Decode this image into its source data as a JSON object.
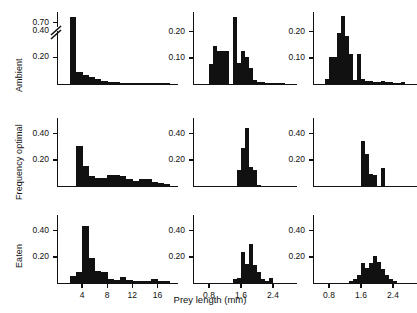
{
  "figure": {
    "xlabel": "Prey length (mm)",
    "row_labels": [
      "Ambient",
      "Frequency optimal",
      "Eaten"
    ],
    "ink_color": "#111111"
  },
  "chart_data": [
    {
      "id": "ambient-left",
      "type": "bar",
      "row": "Ambient",
      "column": 1,
      "title": "",
      "xlabel": "",
      "ylabel": "Ambient",
      "xlim": [
        0,
        18
      ],
      "ylim": [
        0,
        0.78
      ],
      "axis_break": {
        "from": 0.42,
        "to": 0.66,
        "note": "broken y-axis between 0.40 and 0.70"
      },
      "ytick_labels": [
        "0.70",
        "0.40",
        "0.20"
      ],
      "yticks": [
        0.7,
        0.4,
        0.2
      ],
      "xtick_labels": [
        "4",
        "8",
        "12",
        "16"
      ],
      "xticks": [
        4,
        8,
        12,
        16
      ],
      "bin_width": 1,
      "x": [
        2,
        3,
        4,
        5,
        6,
        7,
        8,
        9,
        10,
        11,
        12,
        13,
        14,
        15,
        16,
        17
      ],
      "values": [
        0.74,
        0.09,
        0.07,
        0.055,
        0.035,
        0.022,
        0.015,
        0.012,
        0.01,
        0.008,
        0.008,
        0.006,
        0.006,
        0.005,
        0.004,
        0.004
      ],
      "grid": false
    },
    {
      "id": "ambient-middle",
      "type": "bar",
      "row": "Ambient",
      "column": 2,
      "title": "",
      "xlabel": "",
      "ylabel": "",
      "xlim": [
        0.4,
        2.8
      ],
      "ylim": [
        0,
        0.275
      ],
      "ytick_labels": [
        "0.20",
        "0.10"
      ],
      "yticks": [
        0.2,
        0.1
      ],
      "xtick_labels": [
        "0.8",
        "1.6",
        "2.4"
      ],
      "xticks": [
        0.8,
        1.6,
        2.4
      ],
      "bin_width": 0.1,
      "x": [
        0.8,
        0.9,
        1.0,
        1.1,
        1.2,
        1.3,
        1.4,
        1.5,
        1.6,
        1.7,
        1.8,
        1.9,
        2.0,
        2.1,
        2.2,
        2.3,
        2.4,
        2.5,
        2.6
      ],
      "values": [
        0.075,
        0.145,
        0.125,
        0.125,
        0.125,
        0.0,
        0.255,
        0.08,
        0.125,
        0.105,
        0.06,
        0.015,
        0.008,
        0.006,
        0.005,
        0.004,
        0.004,
        0.003,
        0.003
      ],
      "grid": false
    },
    {
      "id": "ambient-right",
      "type": "bar",
      "row": "Ambient",
      "column": 3,
      "title": "",
      "xlabel": "",
      "ylabel": "",
      "xlim": [
        0.4,
        2.8
      ],
      "ylim": [
        0,
        0.275
      ],
      "ytick_labels": [
        "0.20",
        "0.10"
      ],
      "yticks": [
        0.2,
        0.1
      ],
      "xtick_labels": [
        "0.8",
        "1.6",
        "2.4"
      ],
      "xticks": [
        0.8,
        1.6,
        2.4
      ],
      "bin_width": 0.1,
      "x": [
        0.7,
        0.8,
        0.9,
        1.0,
        1.1,
        1.2,
        1.3,
        1.4,
        1.5,
        1.6,
        1.7,
        1.8,
        1.9,
        2.0,
        2.1,
        2.2,
        2.3,
        2.4,
        2.5,
        2.6
      ],
      "values": [
        0.02,
        0.105,
        0.105,
        0.195,
        0.26,
        0.185,
        0.115,
        0.015,
        0.115,
        0.02,
        0.012,
        0.01,
        0.009,
        0.008,
        0.012,
        0.008,
        0.006,
        0.005,
        0.004,
        0.008
      ],
      "grid": false
    },
    {
      "id": "frequency-optimal-left",
      "type": "bar",
      "row": "Frequency optimal",
      "column": 1,
      "title": "",
      "xlabel": "",
      "ylabel": "Frequency optimal",
      "xlim": [
        0,
        18
      ],
      "ylim": [
        0,
        0.52
      ],
      "ytick_labels": [
        "0.40",
        "0.20"
      ],
      "yticks": [
        0.4,
        0.2
      ],
      "xtick_labels": [
        "4",
        "8",
        "12",
        "16"
      ],
      "xticks": [
        4,
        8,
        12,
        16
      ],
      "bin_width": 1,
      "x": [
        3,
        4,
        5,
        6,
        7,
        8,
        9,
        10,
        11,
        12,
        13,
        14,
        15,
        16,
        17
      ],
      "values": [
        0.305,
        0.155,
        0.075,
        0.06,
        0.065,
        0.085,
        0.085,
        0.075,
        0.055,
        0.035,
        0.055,
        0.055,
        0.03,
        0.025,
        0.012
      ],
      "grid": false
    },
    {
      "id": "frequency-optimal-middle",
      "type": "bar",
      "row": "Frequency optimal",
      "column": 2,
      "title": "",
      "xlabel": "",
      "ylabel": "",
      "xlim": [
        0.4,
        2.8
      ],
      "ylim": [
        0,
        0.52
      ],
      "ytick_labels": [
        "0.40",
        "0.20"
      ],
      "yticks": [
        0.4,
        0.2
      ],
      "xtick_labels": [
        "0.8",
        "1.6",
        "2.4"
      ],
      "xticks": [
        0.8,
        1.6,
        2.4
      ],
      "bin_width": 0.1,
      "x": [
        1.5,
        1.6,
        1.7,
        1.8,
        1.9,
        2.0
      ],
      "values": [
        0.12,
        0.29,
        0.44,
        0.145,
        0.12,
        0.01
      ],
      "grid": false
    },
    {
      "id": "frequency-optimal-right",
      "type": "bar",
      "row": "Frequency optimal",
      "column": 3,
      "title": "",
      "xlabel": "",
      "ylabel": "",
      "xlim": [
        0.4,
        2.8
      ],
      "ylim": [
        0,
        0.52
      ],
      "ytick_labels": [
        "0.40",
        "0.20"
      ],
      "yticks": [
        0.4,
        0.2
      ],
      "xtick_labels": [
        "0.8",
        "1.6",
        "2.4"
      ],
      "xticks": [
        0.8,
        1.6,
        2.4
      ],
      "bin_width": 0.1,
      "x": [
        1.6,
        1.7,
        1.8,
        1.9,
        2.0,
        2.1,
        2.2
      ],
      "values": [
        0.345,
        0.245,
        0.09,
        0.085,
        0.0,
        0.135,
        0.0
      ],
      "grid": false
    },
    {
      "id": "eaten-left",
      "type": "bar",
      "row": "Eaten",
      "column": 1,
      "title": "",
      "xlabel": "Prey length (mm)",
      "ylabel": "Eaten",
      "xlim": [
        0,
        18
      ],
      "ylim": [
        0,
        0.52
      ],
      "ytick_labels": [
        "0.40",
        "0.20"
      ],
      "yticks": [
        0.4,
        0.2
      ],
      "xtick_labels": [
        "4",
        "8",
        "12",
        "16"
      ],
      "xticks": [
        4,
        8,
        12,
        16
      ],
      "bin_width": 1,
      "x": [
        2,
        3,
        4,
        5,
        6,
        7,
        8,
        9,
        10,
        11,
        12,
        13,
        14,
        15,
        16,
        17
      ],
      "values": [
        0.055,
        0.085,
        0.435,
        0.195,
        0.09,
        0.085,
        0.03,
        0.025,
        0.045,
        0.02,
        0.018,
        0.015,
        0.012,
        0.03,
        0.015,
        0.012
      ],
      "grid": false
    },
    {
      "id": "eaten-middle",
      "type": "bar",
      "row": "Eaten",
      "column": 2,
      "title": "",
      "xlabel": "Prey length (mm)",
      "ylabel": "",
      "xlim": [
        0.4,
        2.8
      ],
      "ylim": [
        0,
        0.52
      ],
      "ytick_labels": [
        "0.40",
        "0.20"
      ],
      "yticks": [
        0.4,
        0.2
      ],
      "xtick_labels": [
        "0.8",
        "1.6",
        "2.4"
      ],
      "xticks": [
        0.8,
        1.6,
        2.4
      ],
      "bin_width": 0.1,
      "x": [
        1.4,
        1.5,
        1.6,
        1.7,
        1.8,
        1.9,
        2.0,
        2.1,
        2.2,
        2.3
      ],
      "values": [
        0.03,
        0.035,
        0.235,
        0.145,
        0.295,
        0.135,
        0.085,
        0.03,
        0.012,
        0.035
      ],
      "grid": false
    },
    {
      "id": "eaten-right",
      "type": "bar",
      "row": "Eaten",
      "column": 3,
      "title": "",
      "xlabel": "Prey length (mm)",
      "ylabel": "",
      "xlim": [
        0.4,
        2.8
      ],
      "ylim": [
        0,
        0.52
      ],
      "ytick_labels": [
        "0.40",
        "0.20"
      ],
      "yticks": [
        0.4,
        0.2
      ],
      "xtick_labels": [
        "0.8",
        "1.6",
        "2.4"
      ],
      "xticks": [
        0.8,
        1.6,
        2.4
      ],
      "bin_width": 0.1,
      "x": [
        1.3,
        1.4,
        1.5,
        1.6,
        1.7,
        1.8,
        1.9,
        2.0,
        2.1,
        2.2,
        2.3,
        2.4
      ],
      "values": [
        0.015,
        0.03,
        0.065,
        0.155,
        0.115,
        0.155,
        0.205,
        0.16,
        0.105,
        0.065,
        0.03,
        0.012
      ],
      "grid": false
    }
  ]
}
